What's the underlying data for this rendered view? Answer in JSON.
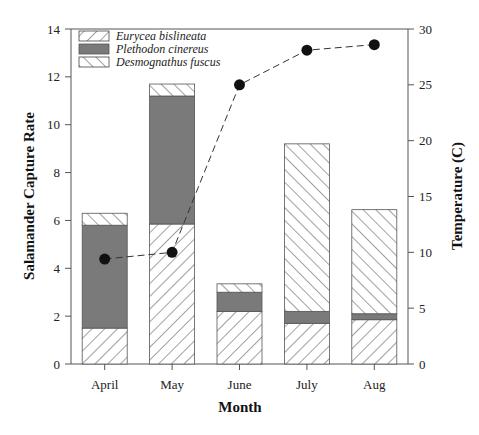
{
  "chart_data": {
    "type": "bar",
    "subtype": "stacked-bar-with-line-secondary-axis",
    "title": "",
    "categories": [
      "April",
      "May",
      "June",
      "July",
      "Aug"
    ],
    "xlabel": "Month",
    "ylabel": "Salamander Capture Rate",
    "ylabel_right": "Temperature (C)",
    "ylim": [
      0,
      14
    ],
    "ylim_right": [
      0,
      30
    ],
    "yticks": [
      0,
      2,
      4,
      6,
      8,
      10,
      12,
      14
    ],
    "yticks_right": [
      0,
      5,
      10,
      15,
      20,
      25,
      30
    ],
    "grid": false,
    "legend_position": "upper-left",
    "series": [
      {
        "name": "Eurycea bislineata",
        "pattern": "forward-hatch",
        "color": "#ffffff",
        "values": [
          1.5,
          5.85,
          2.2,
          1.7,
          1.85
        ]
      },
      {
        "name": "Plethodon cinereus",
        "pattern": "solid",
        "color": "#7a7a7a",
        "values": [
          4.3,
          5.35,
          0.8,
          0.5,
          0.25
        ]
      },
      {
        "name": "Desmognathus fuscus",
        "pattern": "back-hatch",
        "color": "#ffffff",
        "values": [
          0.5,
          0.5,
          0.35,
          7.0,
          4.35
        ]
      }
    ],
    "line_series": {
      "name": "Temperature",
      "axis": "right",
      "style": "dashed-with-markers",
      "values": [
        9.4,
        10.0,
        25.0,
        28.1,
        28.6
      ]
    }
  },
  "labels": {
    "xlabel": "Month",
    "ylabel": "Salamander  Capture  Rate",
    "ylabel_right": "Temperature (C)",
    "legend": [
      "Eurycea bislineata",
      "Plethodon cinereus",
      "Desmognathus fuscus"
    ],
    "months": [
      "April",
      "May",
      "June",
      "July",
      "Aug"
    ],
    "yticks": [
      "0",
      "2",
      "4",
      "6",
      "8",
      "10",
      "12",
      "14"
    ],
    "yticks_right": [
      "0",
      "5",
      "10",
      "15",
      "20",
      "25",
      "30"
    ]
  }
}
